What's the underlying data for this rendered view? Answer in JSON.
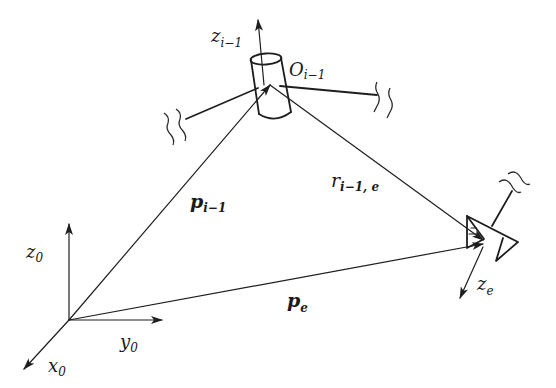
{
  "diagram": {
    "type": "robot-manipulator-kinematics",
    "base_frame": {
      "axes": {
        "z": {
          "base": "z",
          "sub": "0"
        },
        "y": {
          "base": "y",
          "sub": "0"
        },
        "x": {
          "base": "x",
          "sub": "0"
        }
      }
    },
    "joint": {
      "axis_label": {
        "base": "z",
        "sub": "i−1"
      },
      "origin_label": {
        "base": "O",
        "sub": "i−1"
      }
    },
    "end_effector": {
      "axis_label": {
        "base": "z",
        "sub": "e"
      }
    },
    "vectors": {
      "p_prev": {
        "base": "p",
        "sub": "i−1"
      },
      "r": {
        "base": "r",
        "sub": "i−1, e"
      },
      "p_e": {
        "base": "p",
        "sub": "e"
      }
    },
    "colors": {
      "stroke": "#1e1e1e",
      "background": "#ffffff"
    }
  }
}
